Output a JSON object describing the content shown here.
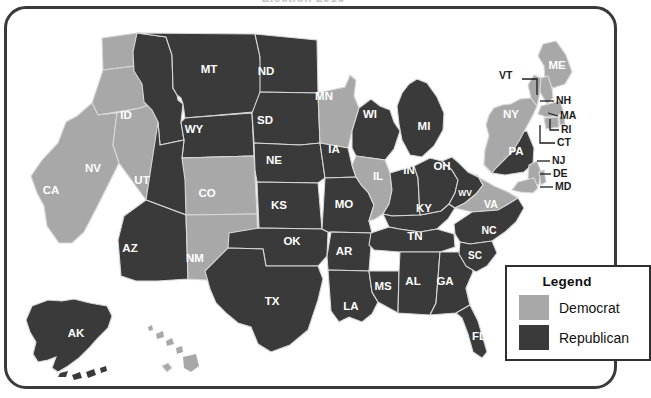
{
  "page": {
    "title_clipped": "Election 2016",
    "frame": {
      "visible": true
    }
  },
  "colors": {
    "democrat": "#a8a8a8",
    "republican": "#3a3a3a",
    "border": "#3a3a3a",
    "state_outline": "#d8d8d8",
    "label_light": "#ffffff",
    "leader_text": "#1d1d1d",
    "background": "#ffffff"
  },
  "legend": {
    "title": "Legend",
    "items": [
      {
        "label": "Democrat",
        "color": "#a8a8a8"
      },
      {
        "label": "Republican",
        "color": "#3a3a3a"
      }
    ]
  },
  "map": {
    "inline_states": [
      {
        "code": "WA",
        "party": "Democrat",
        "x": 84,
        "y": 60
      },
      {
        "code": "OR",
        "party": "Democrat",
        "x": 70,
        "y": 100
      },
      {
        "code": "CA",
        "party": "Democrat",
        "x": 51,
        "y": 194
      },
      {
        "code": "NV",
        "party": "Democrat",
        "x": 93,
        "y": 172
      },
      {
        "code": "ID",
        "party": "Republican",
        "x": 126,
        "y": 119
      },
      {
        "code": "MT",
        "party": "Republican",
        "x": 209,
        "y": 73
      },
      {
        "code": "WY",
        "party": "Republican",
        "x": 194,
        "y": 133
      },
      {
        "code": "UT",
        "party": "Republican",
        "x": 142,
        "y": 184
      },
      {
        "code": "AZ",
        "party": "Republican",
        "x": 130,
        "y": 252
      },
      {
        "code": "CO",
        "party": "Democrat",
        "x": 207,
        "y": 197
      },
      {
        "code": "NM",
        "party": "Democrat",
        "x": 195,
        "y": 262
      },
      {
        "code": "ND",
        "party": "Republican",
        "x": 266,
        "y": 75
      },
      {
        "code": "SD",
        "party": "Republican",
        "x": 265,
        "y": 124
      },
      {
        "code": "NE",
        "party": "Republican",
        "x": 274,
        "y": 164
      },
      {
        "code": "KS",
        "party": "Republican",
        "x": 279,
        "y": 209
      },
      {
        "code": "OK",
        "party": "Republican",
        "x": 292,
        "y": 245
      },
      {
        "code": "TX",
        "party": "Republican",
        "x": 272,
        "y": 305
      },
      {
        "code": "MN",
        "party": "Democrat",
        "x": 324,
        "y": 100
      },
      {
        "code": "IA",
        "party": "Republican",
        "x": 334,
        "y": 153
      },
      {
        "code": "MO",
        "party": "Republican",
        "x": 344,
        "y": 208
      },
      {
        "code": "AR",
        "party": "Republican",
        "x": 344,
        "y": 255
      },
      {
        "code": "LA",
        "party": "Republican",
        "x": 351,
        "y": 310
      },
      {
        "code": "WI",
        "party": "Republican",
        "x": 370,
        "y": 118
      },
      {
        "code": "IL",
        "party": "Democrat",
        "x": 378,
        "y": 180
      },
      {
        "code": "MS",
        "party": "Republican",
        "x": 383,
        "y": 290
      },
      {
        "code": "MI",
        "party": "Republican",
        "x": 424,
        "y": 130
      },
      {
        "code": "IN",
        "party": "Republican",
        "x": 409,
        "y": 174
      },
      {
        "code": "KY",
        "party": "Republican",
        "x": 424,
        "y": 212
      },
      {
        "code": "TN",
        "party": "Republican",
        "x": 415,
        "y": 240
      },
      {
        "code": "AL",
        "party": "Republican",
        "x": 413,
        "y": 285
      },
      {
        "code": "GA",
        "party": "Republican",
        "x": 445,
        "y": 285
      },
      {
        "code": "OH",
        "party": "Republican",
        "x": 442,
        "y": 170
      },
      {
        "code": "WV",
        "party": "Republican",
        "x": 465,
        "y": 196
      },
      {
        "code": "VA",
        "party": "Democrat",
        "x": 491,
        "y": 208
      },
      {
        "code": "NC",
        "party": "Republican",
        "x": 489,
        "y": 234
      },
      {
        "code": "SC",
        "party": "Republican",
        "x": 475,
        "y": 259
      },
      {
        "code": "FL",
        "party": "Republican",
        "x": 479,
        "y": 340
      },
      {
        "code": "PA",
        "party": "Republican",
        "x": 516,
        "y": 155
      },
      {
        "code": "NY",
        "party": "Democrat",
        "x": 511,
        "y": 118
      },
      {
        "code": "ME",
        "party": "Democrat",
        "x": 557,
        "y": 69
      },
      {
        "code": "AK",
        "party": "Republican",
        "x": 76,
        "y": 337
      },
      {
        "code": "HI",
        "party": "Democrat",
        "x": 174,
        "y": 378
      }
    ],
    "leader_states": [
      {
        "code": "VT",
        "party": "Democrat",
        "x": 510,
        "y": 79
      },
      {
        "code": "NH",
        "party": "Democrat",
        "x": 566,
        "y": 104
      },
      {
        "code": "MA",
        "party": "Democrat",
        "x": 570,
        "y": 119
      },
      {
        "code": "RI",
        "party": "Democrat",
        "x": 571,
        "y": 133
      },
      {
        "code": "CT",
        "party": "Democrat",
        "x": 567,
        "y": 146
      },
      {
        "code": "NJ",
        "party": "Democrat",
        "x": 562,
        "y": 164
      },
      {
        "code": "DE",
        "party": "Democrat",
        "x": 563,
        "y": 177
      },
      {
        "code": "MD",
        "party": "Democrat",
        "x": 565,
        "y": 190
      }
    ]
  }
}
